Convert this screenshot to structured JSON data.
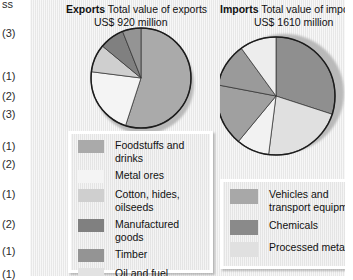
{
  "gutter": {
    "top_label": "ss",
    "marks": [
      "(3)",
      "(1)",
      "(2)",
      "(3)",
      "(1)",
      "(2)",
      "(1)",
      "(2)",
      "(1)",
      "(1)"
    ]
  },
  "exports": {
    "keyword": "Exports",
    "caption_line1": "Total value of exports",
    "caption_line2": "US$ 920 million"
  },
  "imports": {
    "keyword": "Imports",
    "caption_line1": "Total value of imports",
    "caption_line2": "US$ 1610 million"
  },
  "legend_exports": {
    "items": [
      {
        "label": "Foodstuffs and drinks",
        "color": "#aaaaaa"
      },
      {
        "label": "Metal ores",
        "color": "#f4f4f4"
      },
      {
        "label": "Cotton, hides, oilseeds",
        "color": "#cfcfcf"
      },
      {
        "label": "Manufactured goods",
        "color": "#808080"
      },
      {
        "label": "Timber",
        "color": "#949494"
      },
      {
        "label": "Oil and fuel",
        "color": "#e2e2e2"
      }
    ]
  },
  "legend_imports": {
    "items": [
      {
        "label": "Vehicles and transport equipment",
        "color": "#a8a8a8"
      },
      {
        "label": "Chemicals",
        "color": "#8a8a8a"
      },
      {
        "label": "Processed metals",
        "color": "#e0e0e0"
      }
    ]
  },
  "chart_data": [
    {
      "type": "pie",
      "title": "Exports  Total value of exports US$ 920 million",
      "units": "percent of total exports",
      "total_value": "US$ 920 million",
      "legend_position": "below-left",
      "labels": [
        "Foodstuffs and drinks",
        "Metal ores",
        "Cotton, hides, oilseeds",
        "Manufactured goods",
        "Timber"
      ],
      "values": [
        55,
        22,
        9,
        8,
        6
      ],
      "colors": [
        "#aaaaaa",
        "#f4f4f4",
        "#cfcfcf",
        "#808080",
        "#949494"
      ],
      "start_angle_deg": 0,
      "direction": "clockwise"
    },
    {
      "type": "pie",
      "title": "Imports  Total value of imports US$ 1610 million",
      "units": "percent of total imports",
      "total_value": "US$ 1610 million",
      "legend_position": "below-right",
      "labels": [
        "Vehicles and transport equipment",
        "Processed metals",
        "Oil and fuel",
        "Chemicals",
        "Foodstuffs and drinks",
        "Metal ores"
      ],
      "values": [
        30,
        22,
        9,
        17,
        12,
        10
      ],
      "colors": [
        "#8f8f8f",
        "#e0e0e0",
        "#f2f2f2",
        "#a0a0a0",
        "#9a9a9a",
        "#ededed"
      ],
      "start_angle_deg": 0,
      "direction": "clockwise"
    }
  ]
}
